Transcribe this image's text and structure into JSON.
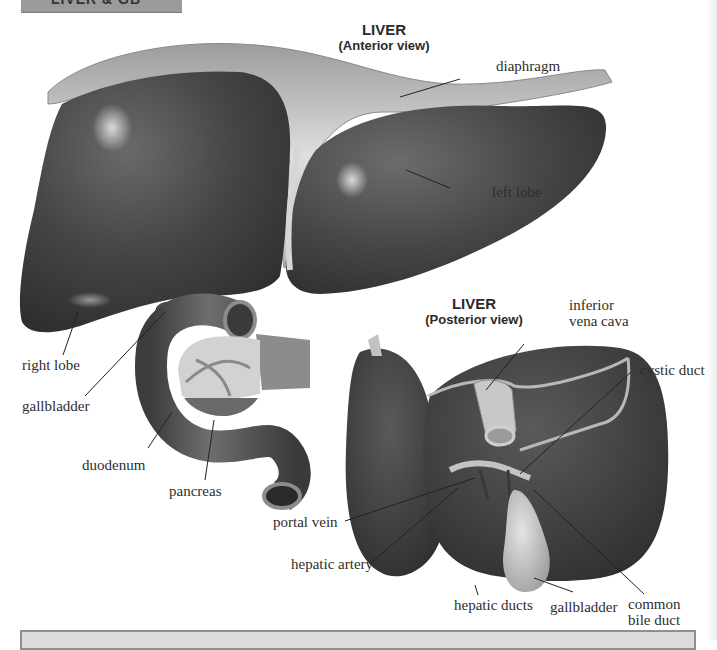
{
  "banner": {
    "text": "LIVER & GB"
  },
  "anterior": {
    "title": "LIVER",
    "subtitle": "(Anterior view)",
    "labels": {
      "diaphragm": "diaphragm",
      "left_lobe": "left lobe",
      "right_lobe": "right lobe",
      "gallbladder": "gallbladder",
      "duodenum": "duodenum",
      "pancreas": "pancreas"
    }
  },
  "posterior": {
    "title": "LIVER",
    "subtitle": "(Posterior view)",
    "labels": {
      "ivc_line1": "inferior",
      "ivc_line2": "vena cava",
      "cystic_duct": "cystic duct",
      "portal_vein": "portal vein",
      "hepatic_artery": "hepatic artery",
      "hepatic_ducts": "hepatic ducts",
      "gallbladder": "gallbladder",
      "cbd_line1": "common",
      "cbd_line2": "bile duct"
    }
  },
  "colors": {
    "liver_dark": "#3a3a3a",
    "liver_mid": "#555555",
    "membrane": "#cfcfcf",
    "gallbladder": "#bdbdbd",
    "leader_line": "#222222"
  }
}
